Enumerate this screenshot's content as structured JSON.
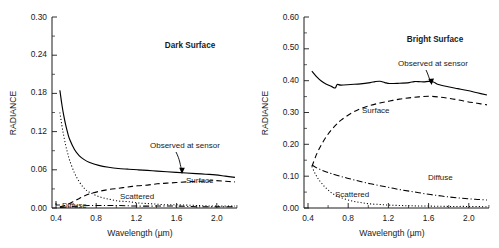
{
  "figure": {
    "panel_count": 2
  },
  "panels": [
    {
      "id": "dark-surface",
      "title": "Dark Surface",
      "ylabel": "RADIANCE",
      "xlabel": "Wavelength (µm)",
      "yticks": [
        "0.00",
        "0.06",
        "0.12",
        "0.18",
        "0.24",
        "0.30"
      ],
      "xticks": [
        "0.4",
        "0.8",
        "1.2",
        "1.6",
        "2.0"
      ],
      "series_labels": {
        "observed": "Observed at sensor",
        "surface": "Surface",
        "scattered": "Scattered",
        "diffuse": "Diffuse"
      }
    },
    {
      "id": "bright-surface",
      "title": "Bright Surface",
      "ylabel": "RADIANCE",
      "xlabel": "Wavelength (µm)",
      "yticks": [
        "0.00",
        "0.10",
        "0.20",
        "0.30",
        "0.40",
        "0.50",
        "0.60"
      ],
      "xticks": [
        "0.4",
        "0.8",
        "1.2",
        "1.6",
        "2.0"
      ],
      "series_labels": {
        "observed": "Observed at sensor",
        "surface": "Surface",
        "diffuse": "Diffuse",
        "scattered": "Scattered"
      }
    }
  ],
  "chart_data": [
    {
      "type": "line",
      "title": "Dark Surface",
      "xlabel": "Wavelength (µm)",
      "ylabel": "RADIANCE",
      "xlim": [
        0.36,
        2.22
      ],
      "ylim": [
        0.0,
        0.3
      ],
      "xticks": [
        0.4,
        0.8,
        1.2,
        1.6,
        2.0
      ],
      "yticks": [
        0.0,
        0.06,
        0.12,
        0.18,
        0.24,
        0.3
      ],
      "grid": false,
      "legend": "inline-annotations",
      "series": [
        {
          "name": "Observed at sensor",
          "style": "solid",
          "x": [
            0.4,
            0.42,
            0.44,
            0.46,
            0.48,
            0.5,
            0.55,
            0.6,
            0.65,
            0.7,
            0.8,
            0.9,
            1.0,
            1.1,
            1.2,
            1.3,
            1.4,
            1.5,
            1.6,
            1.7,
            1.8,
            1.9,
            2.0,
            2.1,
            2.2
          ],
          "y": [
            0.185,
            0.163,
            0.145,
            0.13,
            0.118,
            0.108,
            0.092,
            0.082,
            0.076,
            0.072,
            0.067,
            0.064,
            0.062,
            0.061,
            0.06,
            0.059,
            0.058,
            0.057,
            0.056,
            0.055,
            0.054,
            0.053,
            0.052,
            0.05,
            0.048
          ]
        },
        {
          "name": "Surface",
          "style": "dashed",
          "x": [
            0.4,
            0.45,
            0.5,
            0.55,
            0.6,
            0.65,
            0.7,
            0.8,
            0.9,
            1.0,
            1.1,
            1.2,
            1.3,
            1.4,
            1.5,
            1.6,
            1.7,
            1.8,
            1.9,
            2.0,
            2.1,
            2.2
          ],
          "y": [
            0.002,
            0.004,
            0.007,
            0.011,
            0.015,
            0.019,
            0.022,
            0.026,
            0.029,
            0.031,
            0.033,
            0.035,
            0.036,
            0.038,
            0.039,
            0.04,
            0.041,
            0.042,
            0.042,
            0.043,
            0.042,
            0.041
          ]
        },
        {
          "name": "Scattered",
          "style": "dotted",
          "x": [
            0.4,
            0.42,
            0.44,
            0.46,
            0.48,
            0.5,
            0.55,
            0.6,
            0.65,
            0.7,
            0.8,
            0.9,
            1.0,
            1.1,
            1.2,
            1.3,
            1.4,
            1.5,
            1.6,
            1.8,
            2.0,
            2.2
          ],
          "y": [
            0.15,
            0.13,
            0.113,
            0.098,
            0.086,
            0.075,
            0.055,
            0.041,
            0.031,
            0.025,
            0.018,
            0.014,
            0.011,
            0.01,
            0.008,
            0.007,
            0.006,
            0.005,
            0.005,
            0.004,
            0.003,
            0.003
          ]
        },
        {
          "name": "Diffuse",
          "style": "dash-dot",
          "x": [
            0.4,
            0.5,
            0.6,
            0.7,
            0.8,
            0.9,
            1.0,
            1.2,
            1.4,
            1.6,
            1.8,
            2.0,
            2.2
          ],
          "y": [
            0.001,
            0.002,
            0.003,
            0.004,
            0.004,
            0.004,
            0.004,
            0.003,
            0.003,
            0.003,
            0.002,
            0.002,
            0.002
          ]
        }
      ]
    },
    {
      "type": "line",
      "title": "Bright Surface",
      "xlabel": "Wavelength (µm)",
      "ylabel": "RADIANCE",
      "xlim": [
        0.36,
        2.22
      ],
      "ylim": [
        0.0,
        0.6
      ],
      "xticks": [
        0.4,
        0.8,
        1.2,
        1.6,
        2.0
      ],
      "yticks": [
        0.0,
        0.1,
        0.2,
        0.3,
        0.4,
        0.5,
        0.6
      ],
      "grid": false,
      "legend": "inline-annotations",
      "series": [
        {
          "name": "Observed at sensor",
          "style": "solid",
          "x": [
            0.4,
            0.45,
            0.5,
            0.55,
            0.6,
            0.64,
            0.66,
            0.7,
            0.8,
            0.9,
            1.0,
            1.05,
            1.1,
            1.15,
            1.2,
            1.3,
            1.4,
            1.45,
            1.5,
            1.55,
            1.6,
            1.65,
            1.7,
            1.8,
            1.9,
            2.0,
            2.1,
            2.2
          ],
          "y": [
            0.43,
            0.412,
            0.398,
            0.389,
            0.382,
            0.377,
            0.388,
            0.386,
            0.388,
            0.39,
            0.394,
            0.397,
            0.398,
            0.394,
            0.391,
            0.392,
            0.394,
            0.397,
            0.397,
            0.396,
            0.398,
            0.396,
            0.388,
            0.381,
            0.375,
            0.369,
            0.362,
            0.355
          ]
        },
        {
          "name": "Surface",
          "style": "dashed",
          "x": [
            0.4,
            0.45,
            0.5,
            0.55,
            0.6,
            0.65,
            0.7,
            0.8,
            0.9,
            1.0,
            1.1,
            1.2,
            1.3,
            1.4,
            1.5,
            1.6,
            1.7,
            1.8,
            1.9,
            2.0,
            2.1,
            2.2
          ],
          "y": [
            0.13,
            0.17,
            0.2,
            0.225,
            0.245,
            0.262,
            0.276,
            0.297,
            0.312,
            0.322,
            0.33,
            0.336,
            0.342,
            0.346,
            0.349,
            0.351,
            0.349,
            0.345,
            0.34,
            0.334,
            0.329,
            0.324
          ]
        },
        {
          "name": "Diffuse",
          "style": "dash-dot",
          "x": [
            0.4,
            0.45,
            0.5,
            0.55,
            0.6,
            0.7,
            0.8,
            0.9,
            1.0,
            1.1,
            1.2,
            1.3,
            1.4,
            1.5,
            1.6,
            1.7,
            1.8,
            1.9,
            2.0,
            2.1,
            2.2
          ],
          "y": [
            0.135,
            0.126,
            0.119,
            0.113,
            0.108,
            0.099,
            0.091,
            0.083,
            0.076,
            0.07,
            0.064,
            0.058,
            0.053,
            0.048,
            0.043,
            0.039,
            0.035,
            0.032,
            0.029,
            0.027,
            0.025
          ]
        },
        {
          "name": "Scattered",
          "style": "dotted",
          "x": [
            0.4,
            0.43,
            0.46,
            0.5,
            0.55,
            0.6,
            0.65,
            0.7,
            0.8,
            0.9,
            1.0,
            1.1,
            1.2,
            1.4,
            1.6,
            1.8,
            2.0,
            2.2
          ],
          "y": [
            0.13,
            0.11,
            0.094,
            0.078,
            0.061,
            0.048,
            0.039,
            0.032,
            0.023,
            0.017,
            0.013,
            0.011,
            0.009,
            0.007,
            0.006,
            0.005,
            0.005,
            0.004
          ]
        }
      ]
    }
  ]
}
